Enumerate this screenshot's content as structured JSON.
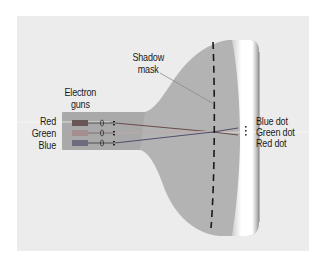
{
  "diagram": {
    "labels": {
      "shadow_mask_line1": "Shadow",
      "shadow_mask_line2": "mask",
      "electron_guns_line1": "Electron",
      "electron_guns_line2": "guns",
      "gun_red": "Red",
      "gun_green": "Green",
      "gun_blue": "Blue",
      "blue_dot": "Blue dot",
      "green_dot": "Green dot",
      "red_dot": "Red dot"
    },
    "colors": {
      "background": "#ffffff",
      "panel": "#ececec",
      "tube": "#b3b3b3",
      "neck": "#a8a8a8",
      "screen_glass": "#ffffff",
      "gun_red": "#6b5656",
      "gun_green": "#a58e8e",
      "gun_blue": "#6f6a80",
      "beam_red": "#8a5050",
      "beam_green": "#9a8080",
      "beam_blue": "#5a5a78",
      "mask": "#1a1a1a"
    }
  }
}
